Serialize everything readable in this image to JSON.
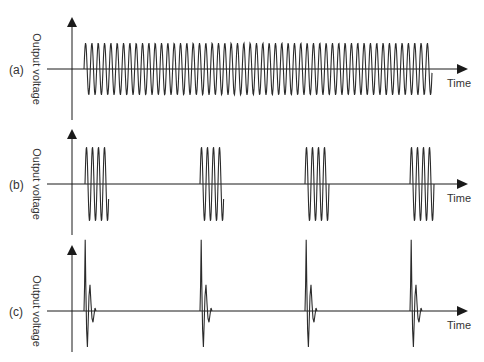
{
  "figure": {
    "colors": {
      "axis": "#1a1a1a",
      "wave": "#2b2b2b",
      "text": "#333333",
      "background": "#ffffff"
    },
    "panels": [
      {
        "id": "a",
        "label": "(a)",
        "ylabel": "Output voltage",
        "xlabel": "Time",
        "description": "Continuous sinusoidal oscillation",
        "layout": {
          "axisX": 72,
          "axisTop": 17,
          "axisBottom": 120,
          "baseline": 69,
          "arrowEnd": 468,
          "amp": 26
        },
        "signal": {
          "type": "continuous",
          "start": 84,
          "end": 432,
          "period": 6.33
        }
      },
      {
        "id": "b",
        "label": "(b)",
        "ylabel": "Output voltage",
        "xlabel": "Time",
        "description": "Periodic bursts of oscillation",
        "layout": {
          "axisX": 72,
          "axisTop": 129,
          "axisBottom": 235,
          "baseline": 184,
          "arrowEnd": 468,
          "amp": 37
        },
        "signal": {
          "type": "burst",
          "starts": [
            85,
            200,
            305,
            410
          ],
          "cycles": 4,
          "period": 6
        }
      },
      {
        "id": "c",
        "label": "(c)",
        "ylabel": "Output voltage",
        "xlabel": "Time",
        "description": "Periodic decaying pulses",
        "layout": {
          "axisX": 72,
          "axisTop": 245,
          "axisBottom": 352,
          "baseline": 311,
          "arrowEnd": 468,
          "amp": 75
        },
        "signal": {
          "type": "pulse",
          "starts": [
            84,
            200,
            305,
            410
          ]
        }
      }
    ]
  }
}
